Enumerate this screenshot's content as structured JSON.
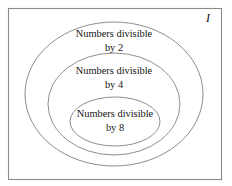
{
  "diagram": {
    "type": "euler-nested-sets",
    "universe": {
      "symbol": "I",
      "name": "universal-set"
    },
    "sets": [
      {
        "id": "divisible-by-2",
        "line1": "Numbers divisible",
        "line2": "by 2",
        "divisor": 2,
        "level": 1
      },
      {
        "id": "divisible-by-4",
        "line1": "Numbers divisible",
        "line2": "by 4",
        "divisor": 4,
        "level": 2
      },
      {
        "id": "divisible-by-8",
        "line1": "Numbers divisible",
        "line2": "by 8",
        "divisor": 8,
        "level": 3
      }
    ],
    "colors": {
      "background": "#ffffff",
      "border": "#8a8a8a",
      "ellipse_stroke": "#8e8e8e",
      "text": "#141414"
    }
  }
}
